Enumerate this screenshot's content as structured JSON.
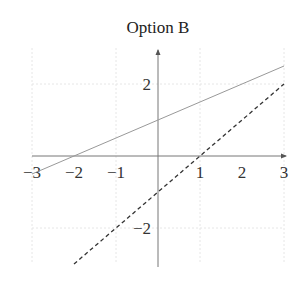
{
  "chart_data": {
    "type": "line",
    "title": "Option B",
    "xlabel": "",
    "ylabel": "",
    "xlim": [
      -3,
      3
    ],
    "ylim": [
      -3,
      3
    ],
    "grid": true,
    "x_ticks": [
      -3,
      -2,
      -1,
      1,
      2,
      3
    ],
    "x_tick_labels": [
      "−3",
      "−2",
      "−1",
      "1",
      "2",
      "3"
    ],
    "y_ticks": [
      -2,
      2
    ],
    "y_tick_labels": [
      "−2",
      "2"
    ],
    "series": [
      {
        "name": "solid line",
        "style": "solid",
        "color": "#999999",
        "equation": "y = 0.5x + 1",
        "x": [
          -3,
          3
        ],
        "y": [
          -0.5,
          2.5
        ]
      },
      {
        "name": "dashed line",
        "style": "dashed",
        "color": "#333333",
        "equation": "y = x - 1",
        "x": [
          -2,
          3
        ],
        "y": [
          -3,
          2
        ]
      }
    ]
  }
}
